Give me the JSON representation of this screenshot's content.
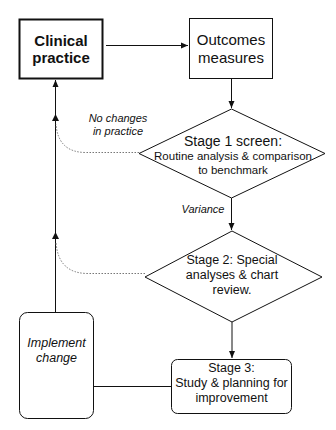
{
  "diagram": {
    "nodes": {
      "clinical_practice": {
        "line1": "Clinical",
        "line2": "practice"
      },
      "outcomes_measures": {
        "line1": "Outcomes",
        "line2": "measures"
      },
      "stage1": {
        "title": "Stage 1 screen:",
        "line1": "Routine  analysis & comparison",
        "line2": "to benchmark"
      },
      "stage2": {
        "line1": "Stage 2: Special",
        "line2": "analyses & chart",
        "line3": "review."
      },
      "stage3": {
        "line1": "Stage 3:",
        "line2": "Study  & planning for",
        "line3": "improvement"
      },
      "implement_change": {
        "line1": "Implement",
        "line2": "change"
      }
    },
    "edge_labels": {
      "no_changes": {
        "line1": "No changes",
        "line2": "in practice"
      },
      "variance": "Variance"
    },
    "colors": {
      "stroke": "#111111",
      "dotted": "#777777",
      "background": "#ffffff"
    }
  }
}
